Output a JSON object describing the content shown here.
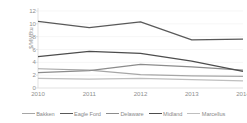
{
  "chart_data": {
    "type": "line",
    "title": "",
    "subtitle": "",
    "xlabel": "",
    "ylabel": "$/MMBtu",
    "x": [
      "2010",
      "2011",
      "2012",
      "2013",
      "2014"
    ],
    "categories": [
      "2010",
      "2011",
      "2012",
      "2013",
      "2014"
    ],
    "ylim": [
      0,
      12
    ],
    "yticks": [
      0,
      2,
      4,
      6,
      8,
      10,
      12
    ],
    "ytick_labels": [
      "0",
      "2",
      "4",
      "6",
      "8",
      "10",
      "12"
    ],
    "grid": true,
    "grid_axis": "y",
    "legend_position": "bottom",
    "series": [
      {
        "name": "Bakken",
        "color": "#a6a6a6",
        "values": [
          3.0,
          2.8,
          2.1,
          1.9,
          1.8
        ]
      },
      {
        "name": "Eagle Ford",
        "color": "#595959",
        "values": [
          10.4,
          9.4,
          10.3,
          7.5,
          7.6
        ]
      },
      {
        "name": "Delaware",
        "color": "#8c8c8c",
        "values": [
          2.4,
          2.7,
          3.7,
          3.3,
          2.8
        ]
      },
      {
        "name": "Midland",
        "color": "#4d4d4d",
        "values": [
          4.9,
          5.7,
          5.4,
          4.2,
          2.6
        ]
      },
      {
        "name": "Marcellus",
        "color": "#bfbfbf",
        "values": [
          1.5,
          1.4,
          1.5,
          1.3,
          1.1
        ]
      }
    ]
  },
  "axis_style": {
    "axis_line_color": "#d9d9d9",
    "grid_color": "#f2f2f2",
    "tick_label_color": "#8f8f8f"
  }
}
